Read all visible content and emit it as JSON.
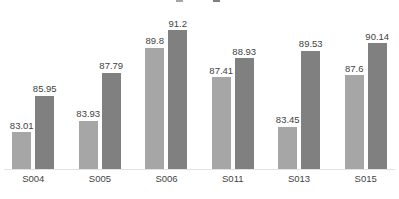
{
  "chart_data": {
    "type": "bar",
    "title": "",
    "subtitle": "",
    "xlabel": "",
    "ylabel": "",
    "categories": [
      "S004",
      "S005",
      "S006",
      "S011",
      "S013",
      "S015"
    ],
    "series": [
      {
        "name": "",
        "color": "#a6a6a6",
        "values": [
          83.01,
          83.93,
          89.8,
          87.41,
          83.45,
          87.6
        ],
        "labels": [
          "83.01",
          "83.93",
          "89.8",
          "87.41",
          "83.45",
          "87.6"
        ]
      },
      {
        "name": "",
        "color": "#808080",
        "values": [
          85.95,
          87.79,
          91.2,
          88.93,
          89.53,
          90.14
        ],
        "labels": [
          "85.95",
          "87.79",
          "91.2",
          "88.93",
          "89.53",
          "90.14"
        ]
      }
    ],
    "ylim": [
      80,
      92
    ],
    "grid": false,
    "legend_position": "top",
    "legend_clipped": true,
    "data_labels": true,
    "axis_line_color": "#e2e2e2",
    "text_color": "#3f3f3f"
  },
  "legend": {
    "entries": [
      {
        "label": "",
        "color": "#a6a6a6"
      },
      {
        "label": "",
        "color": "#808080"
      }
    ]
  }
}
